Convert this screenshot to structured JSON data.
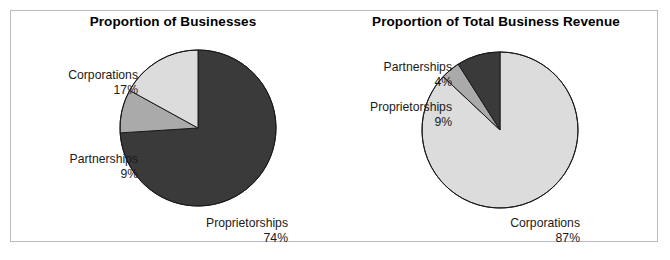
{
  "figure": {
    "width": 670,
    "height": 260,
    "background": "#ffffff",
    "border_color": "#b9bdc1"
  },
  "palette": {
    "dark": "#3a3a3a",
    "mid": "#aaaaaa",
    "light": "#dcdcdc",
    "outline": "#1a1a1a",
    "text": "#1a1a1a",
    "title": "#000000"
  },
  "charts": {
    "left": {
      "title": "Proportion of Businesses",
      "labels": {
        "corporations": {
          "name": "Corporations",
          "pct": "17%"
        },
        "partnerships": {
          "name": "Partnerships",
          "pct": "9%"
        },
        "proprietorships": {
          "name": "Proprietorships",
          "pct": "74%"
        }
      }
    },
    "right": {
      "title": "Proportion of Total Business Revenue",
      "labels": {
        "partnerships": {
          "name": "Partnerships",
          "pct": "4%"
        },
        "proprietorships": {
          "name": "Proprietorships",
          "pct": "9%"
        },
        "corporations": {
          "name": "Corporations",
          "pct": "87%"
        }
      }
    }
  },
  "chart_data": [
    {
      "type": "pie",
      "title": "Proportion of Businesses",
      "xlabel": "",
      "ylabel": "",
      "legend": "none",
      "labels_position": "outside",
      "categories": [
        "Proprietorships",
        "Partnerships",
        "Corporations"
      ],
      "values": [
        74,
        9,
        17
      ],
      "value_suffix": "%",
      "colors": [
        "#3a3a3a",
        "#aaaaaa",
        "#dcdcdc"
      ],
      "start_angle_deg": 0,
      "direction": "clockwise",
      "center": [
        198,
        128
      ],
      "radius": 78
    },
    {
      "type": "pie",
      "title": "Proportion of Total Business Revenue",
      "xlabel": "",
      "ylabel": "",
      "legend": "none",
      "labels_position": "outside",
      "categories": [
        "Corporations",
        "Partnerships",
        "Proprietorships"
      ],
      "values": [
        87,
        4,
        9
      ],
      "value_suffix": "%",
      "colors": [
        "#dcdcdc",
        "#aaaaaa",
        "#3a3a3a"
      ],
      "start_angle_deg": 0,
      "direction": "clockwise",
      "center": [
        500,
        130
      ],
      "radius": 78
    }
  ]
}
